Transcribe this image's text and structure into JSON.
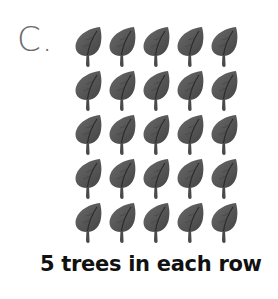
{
  "problem": {
    "label": "C.",
    "caption": "5 trees in each row"
  },
  "array": {
    "rows": 5,
    "columns": 5,
    "item_icon": "tree-leaf-icon",
    "item_color": "#5a5a5a",
    "vein_color": "#2a2a2a"
  }
}
